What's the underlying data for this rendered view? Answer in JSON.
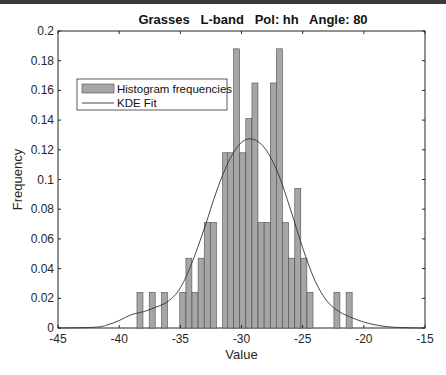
{
  "chart_data": {
    "type": "bar",
    "title": "Grasses   L-band   Pol: hh   Angle: 80",
    "xlabel": "Value",
    "ylabel": "Frequency",
    "xlim": [
      -45,
      -15
    ],
    "ylim": [
      0,
      0.2
    ],
    "xticks": [
      -45,
      -40,
      -35,
      -30,
      -25,
      -20,
      -15
    ],
    "yticks": [
      0,
      0.02,
      0.04,
      0.06,
      0.08,
      0.1,
      0.12,
      0.14,
      0.16,
      0.18,
      0.2
    ],
    "xtick_labels": [
      "-45",
      "-40",
      "-35",
      "-30",
      "-25",
      "-20",
      "-15"
    ],
    "ytick_labels": [
      "0",
      "0.02",
      "0.04",
      "0.06",
      "0.08",
      "0.1",
      "0.12",
      "0.14",
      "0.16",
      "0.18",
      "0.2"
    ],
    "grid": false,
    "legend_position": "upper-left",
    "legend": [
      "Histogram frequencies",
      "KDE Fit"
    ],
    "bin_width": 0.49,
    "series": [
      {
        "name": "Histogram frequencies",
        "type": "bar",
        "color": "#a6a6a6",
        "x": [
          -38.3,
          -37.3,
          -36.3,
          -34.8,
          -34.3,
          -33.8,
          -33.3,
          -32.8,
          -32.3,
          -31.3,
          -30.9,
          -30.4,
          -29.9,
          -29.4,
          -28.9,
          -28.4,
          -27.9,
          -27.4,
          -26.9,
          -26.4,
          -25.9,
          -25.4,
          -24.9,
          -24.4,
          -22.2,
          -21.2
        ],
        "values": [
          0.024,
          0.024,
          0.024,
          0.024,
          0.047,
          0.024,
          0.047,
          0.071,
          0.071,
          0.118,
          0.118,
          0.188,
          0.118,
          0.141,
          0.165,
          0.071,
          0.071,
          0.165,
          0.188,
          0.071,
          0.047,
          0.094,
          0.047,
          0.024,
          0.024,
          0.024
        ]
      },
      {
        "name": "KDE Fit",
        "type": "line",
        "color": "#333333",
        "x": [
          -45,
          -42,
          -41,
          -40,
          -39,
          -38,
          -37,
          -36,
          -35,
          -34,
          -33,
          -32,
          -31,
          -30,
          -29,
          -28,
          -27,
          -26,
          -25,
          -24,
          -23,
          -22,
          -21,
          -20,
          -19,
          -18,
          -17,
          -16,
          -15
        ],
        "values": [
          0.0,
          0.0005,
          0.002,
          0.005,
          0.009,
          0.011,
          0.014,
          0.018,
          0.027,
          0.045,
          0.068,
          0.093,
          0.113,
          0.125,
          0.127,
          0.12,
          0.104,
          0.08,
          0.054,
          0.032,
          0.018,
          0.011,
          0.007,
          0.004,
          0.002,
          0.0008,
          0.0003,
          0.0001,
          0.0
        ]
      }
    ]
  }
}
